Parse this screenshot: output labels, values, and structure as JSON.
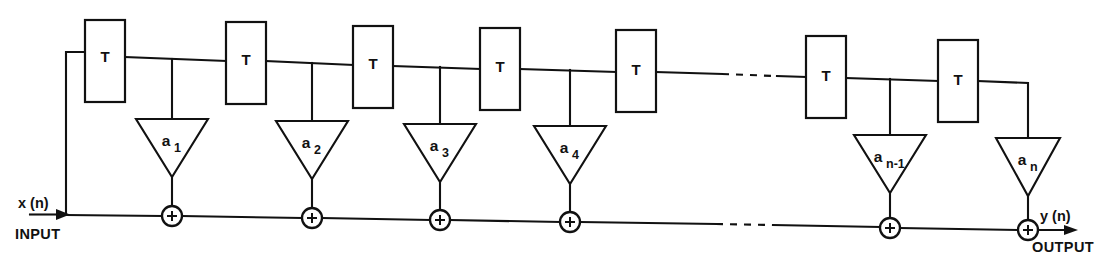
{
  "figure": {
    "kind": "signal-flow-block-diagram",
    "name": "Transversal (FIR) filter with tapped delay line",
    "background_color": "#ffffff",
    "line_color": "#111111",
    "width": 1106,
    "height": 266
  },
  "io": {
    "input_signal_label": "x (n)",
    "input_caption": "INPUT",
    "output_signal_label": "y (n)",
    "output_caption": "OUTPUT"
  },
  "delay_blocks": [
    {
      "id": "T1",
      "label": "T",
      "x": 85,
      "y": 20,
      "w": 40,
      "h": 82
    },
    {
      "id": "T2",
      "label": "T",
      "x": 226,
      "y": 22,
      "w": 40,
      "h": 82
    },
    {
      "id": "T3",
      "label": "T",
      "x": 353,
      "y": 26,
      "w": 40,
      "h": 82
    },
    {
      "id": "T4",
      "label": "T",
      "x": 480,
      "y": 28,
      "w": 40,
      "h": 82
    },
    {
      "id": "T5",
      "label": "T",
      "x": 616,
      "y": 30,
      "w": 40,
      "h": 82
    },
    {
      "id": "T6",
      "label": "T",
      "x": 806,
      "y": 36,
      "w": 40,
      "h": 82
    },
    {
      "id": "T7",
      "label": "T",
      "x": 938,
      "y": 40,
      "w": 40,
      "h": 82
    }
  ],
  "gain_blocks": [
    {
      "id": "g1",
      "base": "a",
      "sub": "1",
      "cx": 172,
      "top": 119,
      "half_w": 36,
      "h": 58
    },
    {
      "id": "g2",
      "base": "a",
      "sub": "2",
      "cx": 312,
      "top": 121,
      "half_w": 36,
      "h": 58
    },
    {
      "id": "g3",
      "base": "a",
      "sub": "3",
      "cx": 440,
      "top": 124,
      "half_w": 36,
      "h": 58
    },
    {
      "id": "g4",
      "base": "a",
      "sub": "4",
      "cx": 570,
      "top": 126,
      "half_w": 36,
      "h": 58
    },
    {
      "id": "g5",
      "base": "a",
      "sub": "n-1",
      "cx": 890,
      "top": 135,
      "half_w": 36,
      "h": 58
    },
    {
      "id": "g6",
      "base": "a",
      "sub": "n",
      "cx": 1028,
      "top": 138,
      "half_w": 32,
      "h": 58
    }
  ],
  "summing_junctions": [
    {
      "id": "s1",
      "symbol": "+",
      "cx": 172,
      "cy": 216,
      "r": 10
    },
    {
      "id": "s2",
      "symbol": "+",
      "cx": 312,
      "cy": 218,
      "r": 10
    },
    {
      "id": "s3",
      "symbol": "+",
      "cx": 440,
      "cy": 220,
      "r": 10
    },
    {
      "id": "s4",
      "symbol": "+",
      "cx": 570,
      "cy": 222,
      "r": 10
    },
    {
      "id": "s5",
      "symbol": "+",
      "cx": 890,
      "cy": 228,
      "r": 10
    },
    {
      "id": "s6",
      "symbol": "+",
      "cx": 1028,
      "cy": 230,
      "r": 10
    }
  ],
  "ellipses": [
    {
      "id": "top-ellipsis",
      "axis": "delay-line",
      "x1": 722,
      "x2": 776,
      "y": 62
    },
    {
      "id": "bottom-ellipsis",
      "axis": "summing-line",
      "x1": 716,
      "x2": 772,
      "y": 224
    }
  ],
  "annotations": {
    "delay_symbol": "T",
    "gain_prefix": "a",
    "tap_count_shown": 6,
    "delay_count_shown": 7
  }
}
